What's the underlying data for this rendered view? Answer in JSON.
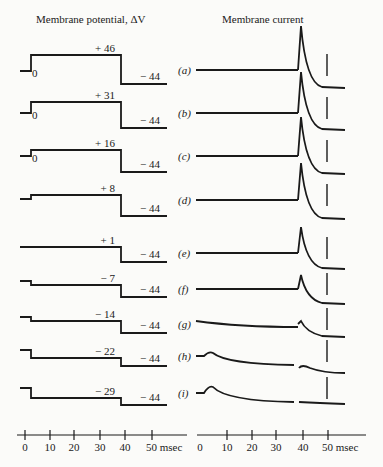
{
  "chart_data": [
    {
      "type": "line",
      "title": "Membrane potential, ΔV",
      "xlabel": "msec",
      "x_ticks": [
        0,
        10,
        20,
        30,
        40,
        50
      ],
      "x_tick_labels": [
        "0",
        "10",
        "20",
        "30",
        "40",
        "50 msec"
      ],
      "xlim": [
        0,
        55
      ],
      "description": "Voltage-clamp step protocols: step from holding level at ~1 msec to test potential, then step at ~38 msec to -44",
      "series": [
        {
          "name": "(a)",
          "test_potential": 46,
          "holding_label": "0",
          "final": -44
        },
        {
          "name": "(b)",
          "test_potential": 31,
          "holding_label": "0",
          "final": -44
        },
        {
          "name": "(c)",
          "test_potential": 16,
          "holding_label": "0",
          "final": -44
        },
        {
          "name": "(d)",
          "test_potential": 8,
          "holding_label": "",
          "final": -44
        },
        {
          "name": "(e)",
          "test_potential": 1,
          "holding_label": "",
          "final": -44
        },
        {
          "name": "(f)",
          "test_potential": -7,
          "holding_label": "",
          "final": -44
        },
        {
          "name": "(g)",
          "test_potential": -14,
          "holding_label": "",
          "final": -44
        },
        {
          "name": "(h)",
          "test_potential": -22,
          "holding_label": "",
          "final": -44
        },
        {
          "name": "(i)",
          "test_potential": -29,
          "holding_label": "",
          "final": -44
        }
      ]
    },
    {
      "type": "line",
      "title": "Membrane current",
      "xlabel": "msec",
      "x_ticks": [
        0,
        10,
        20,
        30,
        40,
        50
      ],
      "x_tick_labels": [
        "0",
        "10",
        "20",
        "30",
        "40",
        "50 msec"
      ],
      "xlim": [
        0,
        55
      ],
      "annotations": [
        "vertical dashed marker at 50 msec"
      ],
      "series": [
        {
          "name": "(a)",
          "transient_at_step_on": "none",
          "tail_peak_relative": 1.0
        },
        {
          "name": "(b)",
          "transient_at_step_on": "none",
          "tail_peak_relative": 0.95
        },
        {
          "name": "(c)",
          "transient_at_step_on": "none",
          "tail_peak_relative": 0.85
        },
        {
          "name": "(d)",
          "transient_at_step_on": "none",
          "tail_peak_relative": 0.8
        },
        {
          "name": "(e)",
          "transient_at_step_on": "none",
          "tail_peak_relative": 0.6
        },
        {
          "name": "(f)",
          "transient_at_step_on": "none",
          "tail_peak_relative": 0.35
        },
        {
          "name": "(g)",
          "transient_at_step_on": "slight slope",
          "tail_peak_relative": 0.05
        },
        {
          "name": "(h)",
          "transient_at_step_on": "small hump ~5 msec",
          "tail_peak_relative": 0.0
        },
        {
          "name": "(i)",
          "transient_at_step_on": "hump ~5 msec",
          "tail_peak_relative": 0.0
        }
      ]
    }
  ],
  "labels": {
    "left_title": "Membrane potential, ΔV",
    "right_title": "Membrane current",
    "rows": [
      "(a)",
      "(b)",
      "(c)",
      "(d)",
      "(e)",
      "(f)",
      "(g)",
      "(h)",
      "(i)"
    ],
    "test_values": [
      "+ 46",
      "+ 31",
      "+ 16",
      "+ 8",
      "+ 1",
      "− 7",
      "− 14",
      "− 22",
      "− 29"
    ],
    "final_value": "− 44",
    "zero": "0",
    "ticks": [
      "0",
      "10",
      "20",
      "30",
      "40",
      "50 msec"
    ]
  }
}
